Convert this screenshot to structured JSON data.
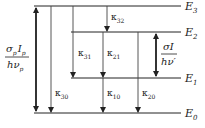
{
  "diagram": {
    "levels": [
      {
        "id": "E3",
        "label": "E",
        "sub": "3",
        "y": 6,
        "x1": 34,
        "x2": 181
      },
      {
        "id": "E2",
        "label": "E",
        "sub": "2",
        "y": 32,
        "x1": 71,
        "x2": 181
      },
      {
        "id": "E1",
        "label": "E",
        "sub": "1",
        "y": 78,
        "x1": 71,
        "x2": 181
      },
      {
        "id": "E0",
        "label": "E",
        "sub": "0",
        "y": 113,
        "x1": 34,
        "x2": 181
      }
    ],
    "transitions": [
      {
        "id": "pump",
        "type": "double",
        "x": 36,
        "from": "E0",
        "to": "E3"
      },
      {
        "id": "k30",
        "type": "decay",
        "x": 51,
        "from": "E3",
        "to": "E0",
        "label": "κ",
        "sub": "30"
      },
      {
        "id": "k31",
        "type": "decay",
        "x": 73,
        "from": "E3",
        "to": "E1",
        "label": "κ",
        "sub": "31"
      },
      {
        "id": "k32",
        "type": "decay",
        "x": 107,
        "from": "E3",
        "to": "E2",
        "label": "κ",
        "sub": "32"
      },
      {
        "id": "k21",
        "type": "decay",
        "x": 103,
        "from": "E2",
        "to": "E1",
        "label": "κ",
        "sub": "21"
      },
      {
        "id": "k10",
        "type": "decay",
        "x": 103,
        "from": "E1",
        "to": "E0",
        "label": "κ",
        "sub": "10"
      },
      {
        "id": "k20",
        "type": "decay",
        "x": 138,
        "from": "E2",
        "to": "E0",
        "label": "κ",
        "sub": "20"
      },
      {
        "id": "stim",
        "type": "double",
        "x": 156,
        "from": "E1",
        "to": "E2"
      }
    ],
    "pump_label": {
      "num_a": "σ",
      "num_a_sub": "p",
      "num_b": "I",
      "num_b_sub": "p",
      "den": "hν",
      "den_sub": "p"
    },
    "stim_label": {
      "num": "σI",
      "den": "hν′"
    }
  }
}
